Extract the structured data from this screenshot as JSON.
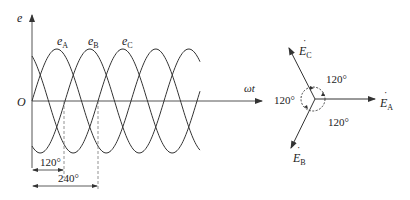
{
  "waveform": {
    "y_axis_label": "e",
    "x_axis_label": "ωt",
    "origin_label": "O",
    "curves": [
      {
        "name": "e",
        "sub": "A",
        "phase_deg": 0
      },
      {
        "name": "e",
        "sub": "B",
        "phase_deg": -120
      },
      {
        "name": "e",
        "sub": "C",
        "phase_deg": -240
      }
    ],
    "dim_120": "120°",
    "dim_240": "240°"
  },
  "phasor": {
    "vectors": [
      {
        "name": "E",
        "sub": "A",
        "angle_deg": 0
      },
      {
        "name": "E",
        "sub": "B",
        "angle_deg": -120
      },
      {
        "name": "E",
        "sub": "C",
        "angle_deg": 120
      }
    ],
    "angle_labels": [
      "120°",
      "120°",
      "120°"
    ]
  },
  "colors": {
    "line": "#333333",
    "axis": "#555555",
    "dash": "#777777"
  }
}
